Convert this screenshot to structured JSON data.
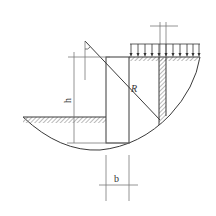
{
  "diagram": {
    "type": "slope-stability-slice-method",
    "labels": {
      "height": "h",
      "radius": "R",
      "width": "b"
    },
    "colors": {
      "line": "#3a3a3a",
      "dim_line": "#7a7a7a",
      "hatch": "#9a9a9a",
      "background": "#ffffff"
    },
    "load_arrows_count": 11
  }
}
